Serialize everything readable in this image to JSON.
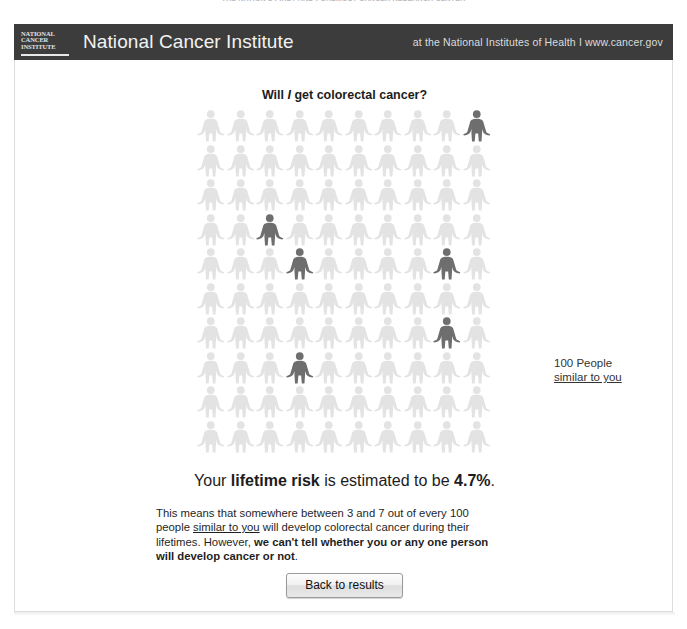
{
  "top_strip": {
    "text": "THE NATION'S FIRST AND FOREMOST CANCER RESEARCH CENTER"
  },
  "header": {
    "logo_lines": [
      "NATIONAL",
      "CANCER",
      "INSTITUTE"
    ],
    "logo_name": "nci-logo",
    "title": "National Cancer Institute",
    "tagline": "at the National Institutes of Health  I  www.cancer.gov",
    "bar_color": "#3c3c3c"
  },
  "main": {
    "question_title_prefix": "Will ",
    "question_title_italic": "I",
    "question_title_suffix": " get colorectal cancer?",
    "legend": {
      "line1": "100 People",
      "line2": "similar to you"
    },
    "risk": {
      "prefix": "Your ",
      "bold1": "lifetime risk",
      "middle": " is estimated to be ",
      "bold2": "4.7%",
      "suffix": "."
    },
    "explanation": {
      "part1": "This means that somewhere between 3 and 7 out of every 100 people ",
      "underlined": "similar to you",
      "part2": " will develop colorectal cancer during their lifetimes. However, ",
      "bold": "we can't tell whether you or any one person will develop cancer or not",
      "part3": "."
    },
    "back_button_label": "Back to results"
  },
  "chart_data": {
    "type": "pictogram",
    "title": "Will I get colorectal cancer?",
    "total": 100,
    "rows": 10,
    "columns": 10,
    "highlighted_count": 6,
    "highlighted_cells": [
      {
        "row": 1,
        "col": 10
      },
      {
        "row": 4,
        "col": 3
      },
      {
        "row": 5,
        "col": 4
      },
      {
        "row": 5,
        "col": 9
      },
      {
        "row": 7,
        "col": 9
      },
      {
        "row": 8,
        "col": 4
      }
    ],
    "lifetime_risk_percent": 4.7,
    "risk_range_low": 3,
    "risk_range_high": 7,
    "legend": [
      "100 People similar to you"
    ],
    "colors": {
      "base_figure": "#e3e3e3",
      "highlight_figure": "#6e6e6e"
    }
  }
}
